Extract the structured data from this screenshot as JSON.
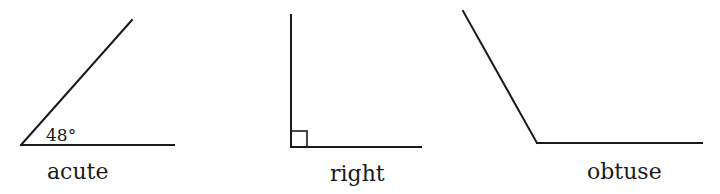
{
  "diagram": {
    "type": "angle-types",
    "angles": [
      {
        "name": "acute",
        "label": "acute",
        "measure_label": "48°",
        "vertex": [
          21,
          145
        ],
        "ray1_end": [
          174,
          145
        ],
        "ray2_end": [
          132,
          20
        ]
      },
      {
        "name": "right",
        "label": "right",
        "right_angle_marker": true,
        "vertex": [
          291,
          147
        ],
        "ray1_end": [
          421,
          147
        ],
        "ray2_end": [
          291,
          15
        ]
      },
      {
        "name": "obtuse",
        "label": "obtuse",
        "vertex": [
          537,
          143
        ],
        "ray1_end": [
          702,
          143
        ],
        "ray2_end": [
          463,
          11
        ]
      }
    ],
    "colors": {
      "line": "#1a1a1a",
      "background": "#ffffff"
    }
  }
}
